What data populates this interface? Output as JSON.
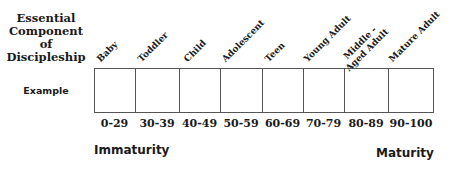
{
  "header": {
    "left_title_lines": [
      "Essential",
      "Component",
      "of",
      "Discipleship"
    ],
    "row_label": "Example"
  },
  "stages": [
    {
      "label": "Baby",
      "range": "0-29"
    },
    {
      "label": "Toddler",
      "range": "30-39"
    },
    {
      "label": "Child",
      "range": "40-49"
    },
    {
      "label": "Adolescent",
      "range": "50-59"
    },
    {
      "label": "Teen",
      "range": "60-69"
    },
    {
      "label": "Young Adult",
      "range": "70-79"
    },
    {
      "label": "Middle - Aged Adult",
      "range": "80-89"
    },
    {
      "label": "Mature Adult",
      "range": "90-100"
    }
  ],
  "scale": {
    "left_label": "Immaturity",
    "right_label": "Maturity"
  }
}
